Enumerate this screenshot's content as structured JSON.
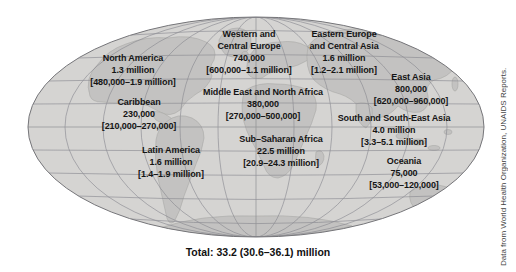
{
  "map": {
    "colors": {
      "ocean": "#d5d4d2",
      "land": "#c4c3c1",
      "grid": "#8a8a90",
      "outline": "#76767a"
    }
  },
  "regions": [
    {
      "name_lines": [
        "North America"
      ],
      "value": "1.3 million",
      "range": "[480,000–1.9 million]"
    },
    {
      "name_lines": [
        "Caribbean"
      ],
      "value": "230,000",
      "range": "[210,000–270,000]"
    },
    {
      "name_lines": [
        "Western and",
        "Central Europe"
      ],
      "value": "740,000",
      "range": "[600,000–1.1 million]"
    },
    {
      "name_lines": [
        "Eastern Europe",
        "and Central Asia"
      ],
      "value": "1.6 million",
      "range": "[1.2–2.1 million]"
    },
    {
      "name_lines": [
        "East Asia"
      ],
      "value": "800,000",
      "range": "[620,000–960,000]"
    },
    {
      "name_lines": [
        "Middle East and North Africa"
      ],
      "value": "380,000",
      "range": "[270,000–500,000]"
    },
    {
      "name_lines": [
        "South and South-East Asia"
      ],
      "value": "4.0 million",
      "range": "[3.3–5.1 million]"
    },
    {
      "name_lines": [
        "Sub–Saharan Africa"
      ],
      "value": "22.5 million",
      "range": "[20.9–24.3 million]"
    },
    {
      "name_lines": [
        "Latin America"
      ],
      "value": "1.6 million",
      "range": "[1.4–1.9 million]"
    },
    {
      "name_lines": [
        "Oceania"
      ],
      "value": "75,000",
      "range": "[53,000–120,000]"
    }
  ],
  "total": {
    "label": "Total: 33.2 (30.6–36.1) million"
  },
  "credit": {
    "text": "Data from World Health Organization, UNAIDS Reports."
  }
}
